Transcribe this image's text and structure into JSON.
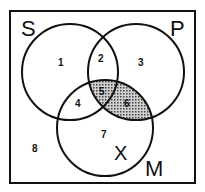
{
  "diagram": {
    "type": "venn",
    "sets": [
      {
        "name": "S",
        "label": "S"
      },
      {
        "name": "P",
        "label": "P"
      },
      {
        "name": "M",
        "label": "M"
      }
    ],
    "regions": [
      {
        "id": 1,
        "label": "1"
      },
      {
        "id": 2,
        "label": "2"
      },
      {
        "id": 3,
        "label": "3"
      },
      {
        "id": 4,
        "label": "4"
      },
      {
        "id": 5,
        "label": "5",
        "shaded": true
      },
      {
        "id": 6,
        "label": "6",
        "shaded": true
      },
      {
        "id": 7,
        "label": "7"
      },
      {
        "id": 8,
        "label": "8"
      }
    ],
    "mark": {
      "label": "X",
      "region": 7
    },
    "colors": {
      "line": "#111111",
      "shade": "#888888",
      "background": "#ffffff"
    }
  }
}
